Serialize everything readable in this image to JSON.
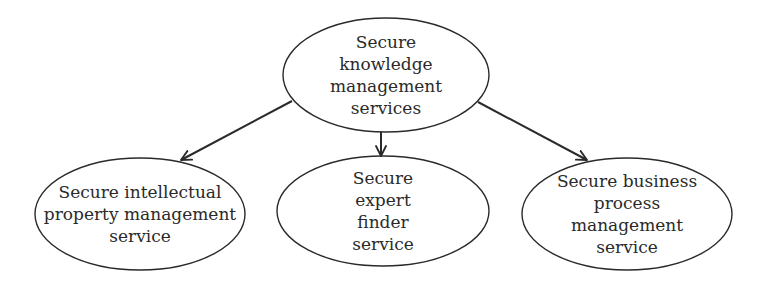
{
  "diagram": {
    "type": "hierarchy",
    "root": {
      "id": "root",
      "label": "Secure\nknowledge\nmanagement\nservices"
    },
    "children": [
      {
        "id": "ip",
        "label": "Secure intellectual\nproperty management\nservice"
      },
      {
        "id": "expert",
        "label": "Secure\nexpert\nfinder\nservice"
      },
      {
        "id": "bpm",
        "label": "Secure business\nprocess\nmanagement\nservice"
      }
    ],
    "edges": [
      {
        "from": "root",
        "to": "ip"
      },
      {
        "from": "root",
        "to": "expert"
      },
      {
        "from": "root",
        "to": "bpm"
      }
    ],
    "colors": {
      "stroke": "#2a2a2a",
      "background": "#ffffff"
    }
  }
}
